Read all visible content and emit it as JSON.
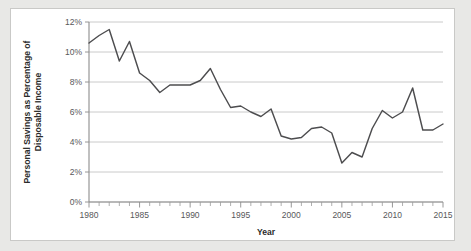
{
  "chart_data": {
    "type": "line",
    "title": "",
    "xlabel": "Year",
    "ylabel": "Personal Savings as Percentage of Disposable Income",
    "ylabel_lines": [
      "Personal Savings as Percentage of",
      "Disposable Income"
    ],
    "xlim": [
      1980,
      2015
    ],
    "ylim": [
      0,
      12
    ],
    "grid": true,
    "legend": "none",
    "ytick_values": [
      0,
      2,
      4,
      6,
      8,
      10,
      12
    ],
    "ytick_labels": [
      "0%",
      "2%",
      "4%",
      "6%",
      "8%",
      "10%",
      "12%"
    ],
    "xtick_values": [
      1980,
      1985,
      1990,
      1995,
      2000,
      2005,
      2010,
      2015
    ],
    "xtick_labels": [
      "1980",
      "1985",
      "1990",
      "1995",
      "2000",
      "2005",
      "2010",
      "2015"
    ],
    "xtick_minor_step": 1,
    "line_color": "#4d4d4f",
    "gridline_color": "#c4c4c4",
    "axis_color": "#8c8c8c",
    "panel_background": "#ffffff",
    "figure_background": "#e8e8e6",
    "x": [
      1980,
      1981,
      1982,
      1983,
      1984,
      1985,
      1986,
      1987,
      1988,
      1989,
      1990,
      1991,
      1992,
      1993,
      1994,
      1995,
      1996,
      1997,
      1998,
      1999,
      2000,
      2001,
      2002,
      2003,
      2004,
      2005,
      2006,
      2007,
      2008,
      2009,
      2010,
      2011,
      2012,
      2013,
      2014,
      2015
    ],
    "values": [
      10.6,
      11.1,
      11.5,
      9.4,
      10.7,
      8.6,
      8.1,
      7.3,
      7.8,
      7.8,
      7.8,
      8.1,
      8.9,
      7.5,
      6.3,
      6.4,
      6.0,
      5.7,
      6.2,
      4.4,
      4.2,
      4.3,
      4.9,
      5.0,
      4.6,
      2.6,
      3.3,
      3.0,
      4.9,
      6.1,
      5.6,
      6.0,
      7.6,
      4.8,
      4.8,
      5.2
    ]
  }
}
